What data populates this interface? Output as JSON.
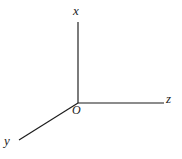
{
  "figure": {
    "kind": "3d-coordinate-axes",
    "background_color": "#ffffff",
    "line_color": "#1b1b1b",
    "width": 182,
    "height": 159,
    "origin": {
      "x": 78,
      "y": 103,
      "label": "O"
    },
    "axes": [
      {
        "name": "x-axis",
        "label": "x",
        "from": {
          "x": 78,
          "y": 103
        },
        "to": {
          "x": 78,
          "y": 22
        },
        "direction": "up"
      },
      {
        "name": "y-axis",
        "label": "y",
        "from": {
          "x": 78,
          "y": 103
        },
        "to": {
          "x": 19,
          "y": 140
        },
        "direction": "down-left"
      },
      {
        "name": "z-axis",
        "label": "z",
        "from": {
          "x": 78,
          "y": 103
        },
        "to": {
          "x": 164,
          "y": 103
        },
        "direction": "right"
      }
    ],
    "labels": {
      "x": "x",
      "y": "y",
      "z": "z",
      "origin": "O"
    }
  }
}
